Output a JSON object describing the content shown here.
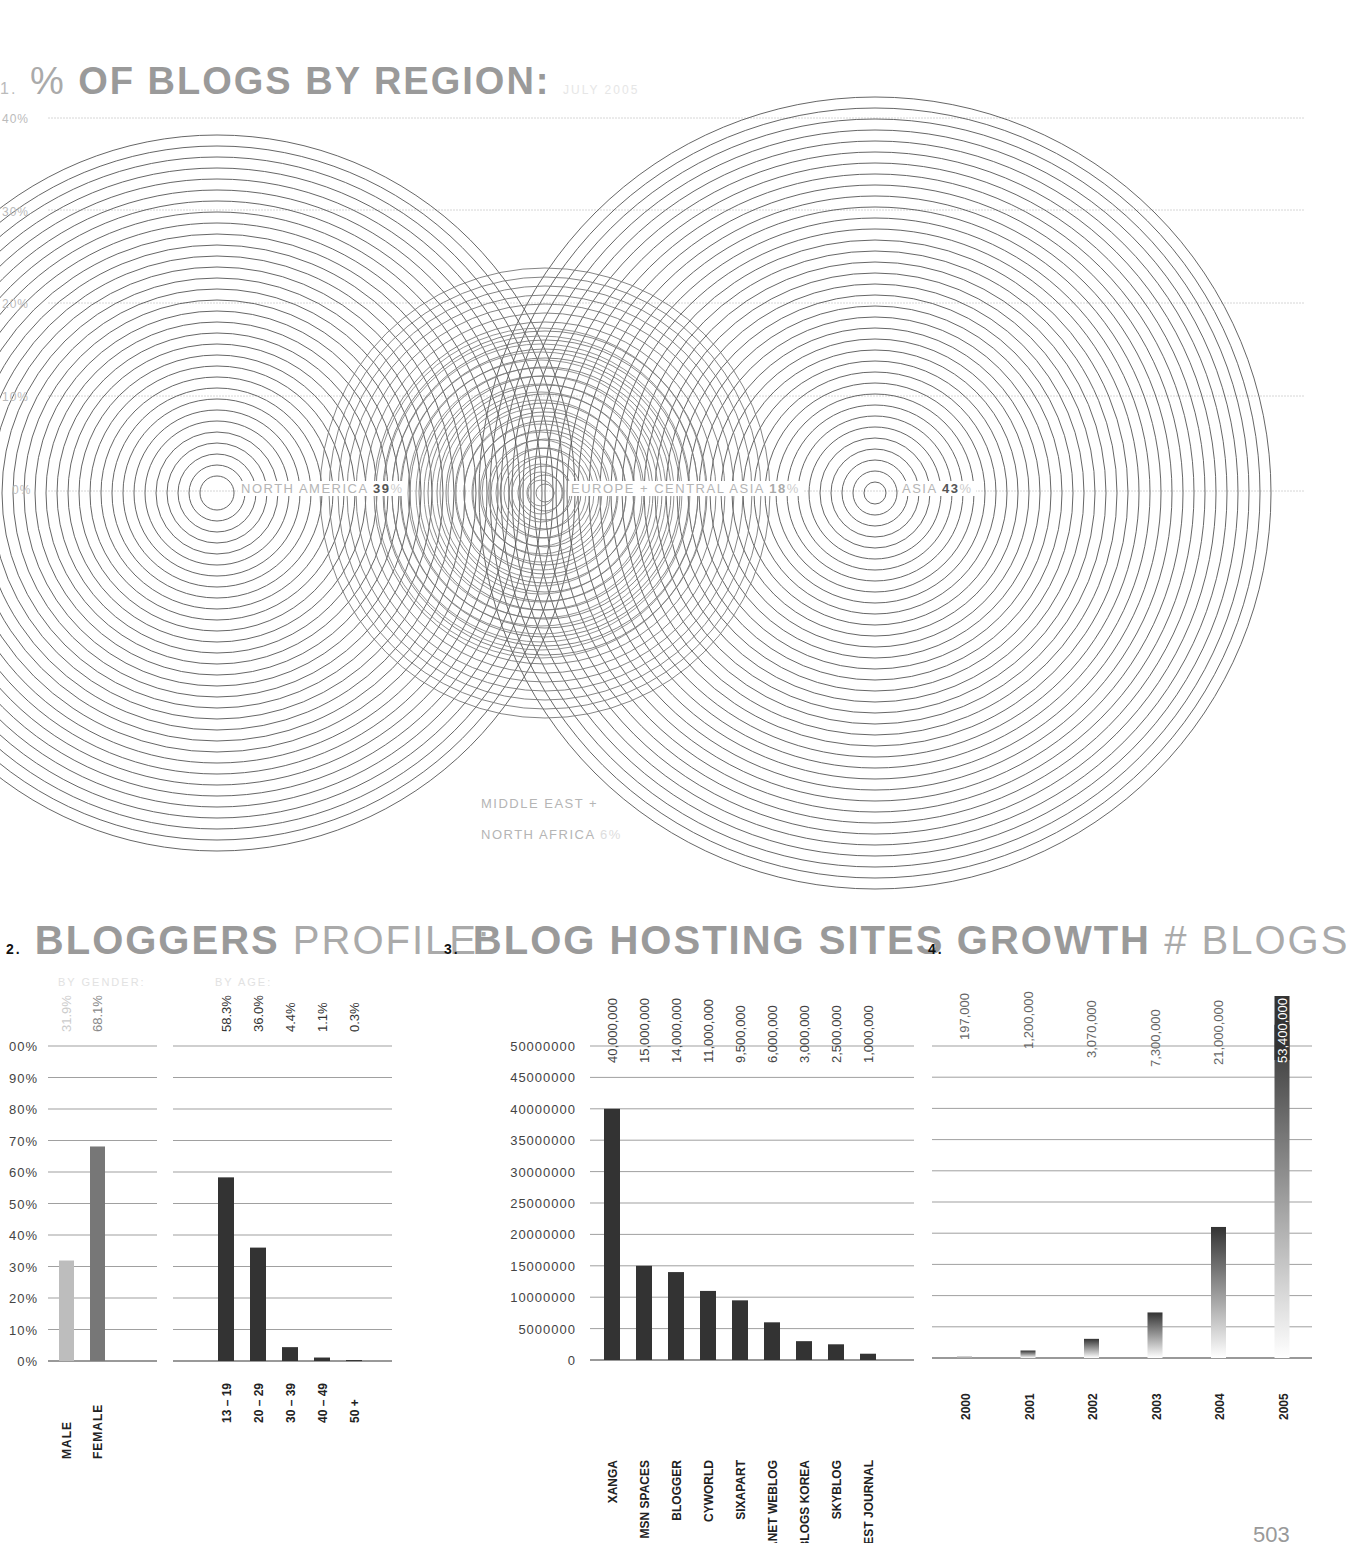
{
  "section1": {
    "number": "1.",
    "title_pre": "%",
    "title": "OF BLOGS BY REGION:",
    "subtitle": "JULY 2005",
    "grid_labels": [
      "40%",
      "30%",
      "20%",
      "10%",
      "0%"
    ],
    "regions": [
      {
        "name": "NORTH AMERICA",
        "value": "39",
        "unit": "%"
      },
      {
        "name": "EUROPE + CENTRAL ASIA",
        "value": "18",
        "unit": "%"
      },
      {
        "name": "ASIA",
        "value": "43",
        "unit": "%"
      },
      {
        "name_line1": "MIDDLE EAST +",
        "name_line2": "NORTH AFRICA",
        "value": "6",
        "unit": "%"
      }
    ]
  },
  "section2": {
    "number": "2.",
    "title_bold": "BLOGGERS",
    "title_light": "PROFILE:",
    "sub_gender": "BY GENDER:",
    "sub_age": "BY AGE:",
    "y_ticks": [
      "00%",
      "90%",
      "80%",
      "70%",
      "60%",
      "50%",
      "40%",
      "30%",
      "20%",
      "10%",
      "0%"
    ]
  },
  "section3": {
    "number": "3.",
    "title": "BLOG HOSTING SITES",
    "y_ticks": [
      "50000000",
      "45000000",
      "40000000",
      "35000000",
      "30000000",
      "25000000",
      "20000000",
      "15000000",
      "10000000",
      "5000000",
      "0"
    ]
  },
  "section4": {
    "number": "4.",
    "title_bold": "GROWTH",
    "title_light": "# BLOGS"
  },
  "page_number": "503",
  "chart_data": [
    {
      "type": "bubble",
      "title": "% OF BLOGS BY REGION: JULY 2005",
      "categories": [
        "North America",
        "Europe + Central Asia",
        "Asia",
        "Middle East + North Africa"
      ],
      "values": [
        39,
        18,
        43,
        6
      ],
      "unit": "%",
      "ylim": [
        0,
        40
      ],
      "grid": true
    },
    {
      "type": "bar",
      "title": "BLOGGERS PROFILE: BY GENDER",
      "categories": [
        "MALE",
        "FEMALE"
      ],
      "values": [
        31.9,
        68.1
      ],
      "labels": [
        "31.9%",
        "68.1%"
      ],
      "ylabel": "%",
      "ylim": [
        0,
        100
      ],
      "grid": true
    },
    {
      "type": "bar",
      "title": "BLOGGERS PROFILE: BY AGE",
      "categories": [
        "13 – 19",
        "20 – 29",
        "30 – 39",
        "40 – 49",
        "50 +"
      ],
      "values": [
        58.3,
        36.0,
        4.4,
        1.1,
        0.3
      ],
      "labels": [
        "58.3%",
        "36.0%",
        "4.4%",
        "1.1%",
        "0.3%"
      ],
      "ylim": [
        0,
        100
      ],
      "grid": true
    },
    {
      "type": "bar",
      "title": "BLOG HOSTING SITES",
      "categories": [
        "XANGA",
        "MSN SPACES",
        "BLOGGER",
        "CYWORLD",
        "SIXAPART",
        "PLANET WEBLOG",
        "YAHOO BLOGS KOREA",
        "SKYBLOG",
        "GREATEST JOURNAL"
      ],
      "values": [
        40000000,
        15000000,
        14000000,
        11000000,
        9500000,
        6000000,
        3000000,
        2500000,
        1000000
      ],
      "labels": [
        "40,000,000",
        "15,000,000",
        "14,000,000",
        "11,000,000",
        "9,500,000",
        "6,000,000",
        "3,000,000",
        "2,500,000",
        "1,000,000"
      ],
      "ylim": [
        0,
        50000000
      ],
      "grid": true
    },
    {
      "type": "bar",
      "title": "GROWTH # BLOGS",
      "categories": [
        "2000",
        "2001",
        "2002",
        "2003",
        "2004",
        "2005"
      ],
      "values": [
        197000,
        1200000,
        3070000,
        7300000,
        21000000,
        53400000
      ],
      "labels": [
        "197,000",
        "1,200,000",
        "3,070,000",
        "7,300,000",
        "21,000,000",
        "53,400,000"
      ],
      "ylim": [
        0,
        50000000
      ],
      "grid": true
    }
  ]
}
